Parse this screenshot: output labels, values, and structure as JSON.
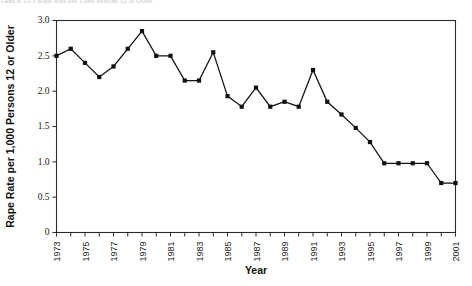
{
  "figure": {
    "caption_fragment": "TABLE 12-1   Rape Rate per 1,000 Persons 12 or Older"
  },
  "chart_data": {
    "type": "line",
    "title": "",
    "xlabel": "Year",
    "ylabel": "Rape Rate per 1,000 Persons 12 or Older",
    "xlim": [
      1973,
      2001
    ],
    "ylim": [
      0,
      3.0
    ],
    "grid": false,
    "legend": "none",
    "marker": "square",
    "line_color": "#111111",
    "marker_color": "#111111",
    "y_ticks": [
      0,
      0.5,
      1.0,
      1.5,
      2.0,
      2.5,
      3.0
    ],
    "y_tick_labels": [
      "0",
      "0.5",
      "1.0",
      "1.5",
      "2.0",
      "2.5",
      "3.0"
    ],
    "x_ticks": [
      1973,
      1974,
      1975,
      1976,
      1977,
      1978,
      1979,
      1980,
      1981,
      1982,
      1983,
      1984,
      1985,
      1986,
      1987,
      1988,
      1989,
      1990,
      1991,
      1992,
      1993,
      1994,
      1995,
      1996,
      1997,
      1998,
      1999,
      2000,
      2001
    ],
    "x_tick_labels": [
      "1973",
      "",
      "1975",
      "",
      "1977",
      "",
      "1979",
      "",
      "1981",
      "",
      "1983",
      "",
      "1985",
      "",
      "1987",
      "",
      "1989",
      "",
      "1991",
      "",
      "1993",
      "",
      "1995",
      "",
      "1997",
      "",
      "1999",
      "",
      "2001"
    ],
    "x": [
      1973,
      1974,
      1975,
      1976,
      1977,
      1978,
      1979,
      1980,
      1981,
      1982,
      1983,
      1984,
      1985,
      1986,
      1987,
      1988,
      1989,
      1990,
      1991,
      1992,
      1993,
      1994,
      1995,
      1996,
      1997,
      1998,
      1999,
      2000,
      2001
    ],
    "values": [
      2.5,
      2.6,
      2.4,
      2.2,
      2.35,
      2.6,
      2.85,
      2.5,
      2.5,
      2.15,
      2.15,
      2.55,
      1.93,
      1.78,
      2.05,
      1.78,
      1.85,
      1.78,
      2.3,
      1.85,
      1.67,
      1.48,
      1.28,
      0.98,
      0.98,
      0.98,
      0.98,
      0.7,
      0.7
    ]
  }
}
